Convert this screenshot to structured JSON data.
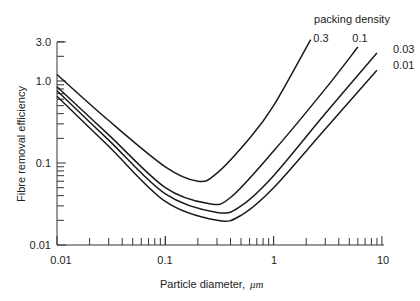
{
  "chart_data": {
    "type": "line",
    "title": "",
    "xlabel": "Particle diameter, μm",
    "ylabel": "Fibre removal efficiency",
    "xscale": "log",
    "yscale": "log",
    "xlim": [
      0.01,
      10
    ],
    "ylim": [
      0.01,
      3.0
    ],
    "x_ticks": [
      "0.01",
      "0.1",
      "1",
      "10"
    ],
    "y_ticks": [
      "0.01",
      "0.1",
      "1.0",
      "3.0"
    ],
    "legend_title": "packing density",
    "legend_position": "top-right, labels at curve ends",
    "grid": false,
    "series": [
      {
        "name": "0.3",
        "x": [
          0.01,
          0.03,
          0.1,
          0.2,
          0.3,
          0.6,
          1.0,
          2.2
        ],
        "y": [
          1.2,
          0.33,
          0.09,
          0.06,
          0.075,
          0.2,
          0.5,
          3.2
        ]
      },
      {
        "name": "0.1",
        "x": [
          0.01,
          0.03,
          0.1,
          0.25,
          0.4,
          1.0,
          3.0,
          6.0
        ],
        "y": [
          0.85,
          0.22,
          0.05,
          0.032,
          0.038,
          0.14,
          0.8,
          2.6
        ]
      },
      {
        "name": "0.03",
        "x": [
          0.01,
          0.03,
          0.1,
          0.3,
          0.5,
          1.0,
          3.0,
          9.0
        ],
        "y": [
          0.76,
          0.19,
          0.042,
          0.025,
          0.03,
          0.07,
          0.4,
          2.2
        ]
      },
      {
        "name": "0.01",
        "x": [
          0.01,
          0.03,
          0.1,
          0.3,
          0.5,
          1.0,
          3.0,
          9.0
        ],
        "y": [
          0.65,
          0.16,
          0.034,
          0.02,
          0.023,
          0.05,
          0.26,
          1.35
        ]
      }
    ]
  },
  "labels": {
    "legend_title": "packing density",
    "xlabel_text": "Particle diameter,",
    "xlabel_unit": "μm",
    "ylabel": "Fibre removal efficiency",
    "y_tick_3": "3.0",
    "y_tick_1": "1.0",
    "y_tick_01": "0.1",
    "y_tick_001": "0.01",
    "x_tick_001": "0.01",
    "x_tick_01": "0.1",
    "x_tick_1": "1",
    "x_tick_10": "10",
    "series_03": "0.3",
    "series_01": "0.1",
    "series_003": "0.03",
    "series_001": "0.01"
  }
}
